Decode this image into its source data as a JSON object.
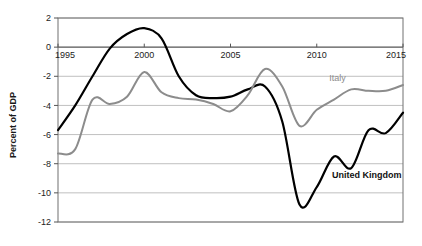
{
  "chart_data": {
    "type": "line",
    "title": "",
    "xlabel": "",
    "ylabel": "Percent of GDP",
    "xlim": [
      1995,
      2015
    ],
    "ylim": [
      -12,
      2
    ],
    "xticks": [
      1995,
      2000,
      2005,
      2010,
      2015
    ],
    "yticks": [
      2,
      0,
      -2,
      -4,
      -6,
      -8,
      -10,
      -12
    ],
    "xtick_labels": [
      "1995",
      "2000",
      "2005",
      "2010",
      "2015"
    ],
    "ytick_labels": [
      "2",
      "0",
      "-2",
      "-4",
      "-6",
      "-8",
      "-10",
      "-12"
    ],
    "grid": true,
    "grid_axis": "y",
    "legend_position": "inline-annotation",
    "x": [
      1995,
      1996,
      1997,
      1998,
      1999,
      2000,
      2001,
      2002,
      2003,
      2004,
      2005,
      2006,
      2007,
      2008,
      2009,
      2010,
      2011,
      2012,
      2013,
      2014,
      2015
    ],
    "series": [
      {
        "name": "United Kingdom",
        "color": "#000000",
        "label_color": "#111111",
        "values": [
          -5.7,
          -4.0,
          -2.0,
          -0.1,
          0.9,
          1.3,
          0.6,
          -2.0,
          -3.3,
          -3.5,
          -3.4,
          -2.9,
          -2.7,
          -5.1,
          -10.8,
          -9.6,
          -7.5,
          -8.3,
          -5.7,
          -5.9,
          -4.5
        ]
      },
      {
        "name": "Italy",
        "color": "#8c8c8c",
        "label_color": "#8c8c8c",
        "values": [
          -7.3,
          -7.0,
          -3.6,
          -3.9,
          -3.4,
          -1.7,
          -3.1,
          -3.5,
          -3.6,
          -3.9,
          -4.4,
          -3.3,
          -1.5,
          -2.7,
          -5.4,
          -4.3,
          -3.6,
          -2.9,
          -3.0,
          -3.0,
          -2.6
        ]
      }
    ],
    "annotations": [
      {
        "text": "Italy",
        "x": 2011.2,
        "y": -2.35,
        "bold": false,
        "color": "#8c8c8c"
      },
      {
        "text": "United Kingdom",
        "x": 2012.9,
        "y": -9.0,
        "bold": true,
        "color": "#111111"
      }
    ]
  }
}
